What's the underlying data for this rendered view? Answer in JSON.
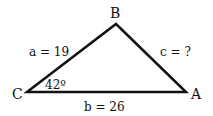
{
  "diagram": {
    "type": "triangle",
    "vertices": {
      "A": {
        "label": "A",
        "x": 186,
        "y": 92
      },
      "B": {
        "label": "B",
        "x": 116,
        "y": 24
      },
      "C": {
        "label": "C",
        "x": 27,
        "y": 92
      }
    },
    "sides": {
      "a": {
        "label": "a = 19",
        "between": [
          "B",
          "C"
        ]
      },
      "b": {
        "label": "b = 26",
        "between": [
          "C",
          "A"
        ]
      },
      "c": {
        "label": "c = ?",
        "between": [
          "A",
          "B"
        ]
      }
    },
    "angles": {
      "C": {
        "label": "42º"
      }
    },
    "colors": {
      "stroke": "#111111",
      "background": "#ffffff"
    }
  }
}
